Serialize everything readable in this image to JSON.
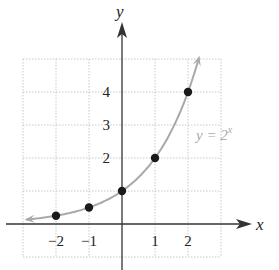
{
  "chart_data": {
    "type": "line",
    "title": "",
    "xlabel": "x",
    "ylabel": "y",
    "xlim": [
      -3,
      3
    ],
    "ylim": [
      -1,
      5
    ],
    "grid": true,
    "x_ticks": [
      -2,
      -1,
      1,
      2
    ],
    "x_tick_labels": [
      "−2",
      "−1",
      "1",
      "2"
    ],
    "y_ticks": [
      2,
      3,
      4
    ],
    "y_tick_labels": [
      "2",
      "3",
      "4"
    ],
    "series": [
      {
        "name": "y = 2^x",
        "function": "2^x",
        "curve_domain": [
          -2.9,
          2.3
        ],
        "points": [
          {
            "x": -2,
            "y": 0.25
          },
          {
            "x": -1,
            "y": 0.5
          },
          {
            "x": 0,
            "y": 1
          },
          {
            "x": 1,
            "y": 2
          },
          {
            "x": 2,
            "y": 4
          }
        ]
      }
    ],
    "annotations": [
      {
        "text": "y = 2",
        "superscript": "x",
        "near": {
          "x": 1.5,
          "y": 2.8
        }
      }
    ]
  },
  "colors": {
    "axis": "#333333",
    "grid": "#c8c8c8",
    "curve": "#a9a9a9",
    "point": "#1a1a1a",
    "label_curve": "#aaaaaa"
  },
  "labels": {
    "x_axis": "x",
    "y_axis": "y",
    "curve_base": "y = 2",
    "curve_exp": "x"
  }
}
